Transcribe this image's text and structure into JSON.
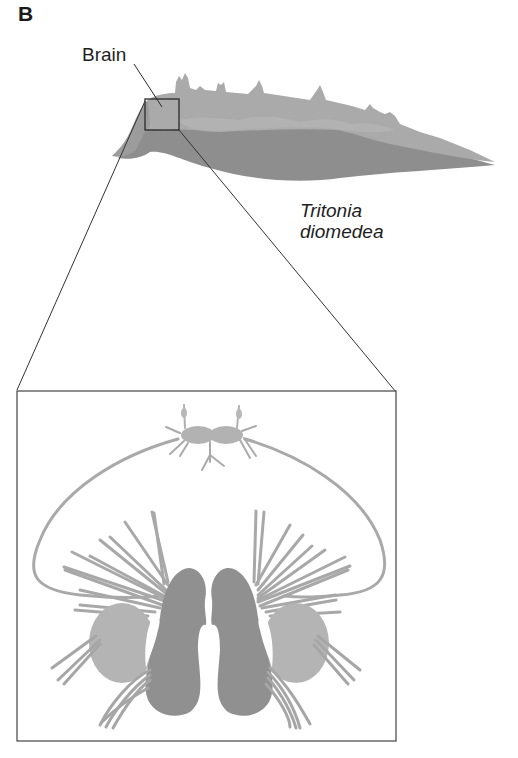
{
  "figure": {
    "panel_label": "B",
    "labels": {
      "brain": "Brain",
      "species_line1": "Tritonia",
      "species_line2": "diomedea"
    },
    "colors": {
      "body_light": "#ababab",
      "body_dark": "#8f8f8f",
      "body_mid": "#9d9d9d",
      "nerve": "#a9a9a9",
      "ganglion_dark": "#8d8d8d",
      "ganglion_light": "#b5b5b5",
      "line": "#2b2b2b",
      "box": "#333333"
    },
    "elements": {
      "organism": "Sea slug side view",
      "inset_box": "Brain location box",
      "zoom_panel": "Enlarged brain (ganglia) schematic"
    }
  }
}
